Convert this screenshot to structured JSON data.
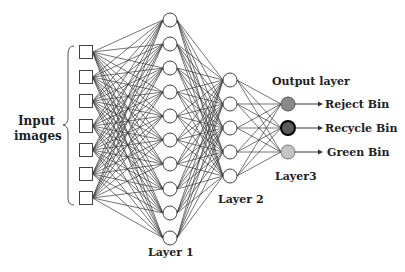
{
  "diagram": {
    "type": "neural-network",
    "labels": {
      "input": [
        "Input",
        "images"
      ],
      "layer1": "Layer 1",
      "layer2": "Layer 2",
      "layer3": "Layer3",
      "output_layer": "Output layer"
    },
    "layers": {
      "input": {
        "shape": "square",
        "count": 7,
        "x": 86,
        "ys": [
          52,
          77,
          101,
          126,
          150,
          174,
          198
        ]
      },
      "layer1": {
        "shape": "circle",
        "count": 10,
        "x": 170,
        "ys": [
          20,
          44,
          68,
          92,
          116,
          140,
          164,
          189,
          213,
          238
        ]
      },
      "layer2": {
        "shape": "circle",
        "count": 5,
        "x": 230,
        "ys": [
          80,
          104,
          128,
          152,
          176
        ]
      },
      "output": {
        "shape": "circle",
        "count": 3,
        "x": 288,
        "ys": [
          104,
          128,
          152
        ]
      }
    },
    "outputs": [
      {
        "label": "Reject Bin",
        "fill": "#8a8a8a",
        "stroke": "#555555"
      },
      {
        "label": "Recycle Bin",
        "fill": "#5a5a5a",
        "stroke": "#000000"
      },
      {
        "label": "Green Bin",
        "fill": "#c4c4c4",
        "stroke": "#777777"
      }
    ],
    "colors": {
      "edge": "#3a3a3a",
      "node_stroke": "#444444",
      "node_fill": "#ffffff"
    }
  }
}
